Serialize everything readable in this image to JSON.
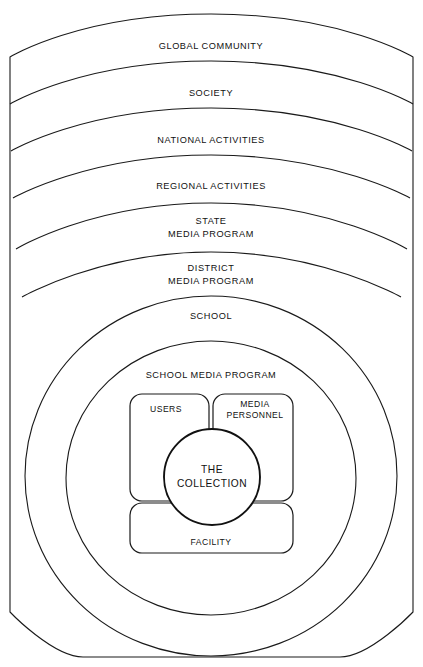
{
  "diagram": {
    "type": "concentric-nested-rings",
    "stroke_color": "#1a1a1a",
    "background_color": "#ffffff",
    "rings": [
      {
        "id": "global-community",
        "label": "GLOBAL COMMUNITY",
        "lines": [
          "GLOBAL COMMUNITY"
        ],
        "level": 1
      },
      {
        "id": "society",
        "label": "SOCIETY",
        "lines": [
          "SOCIETY"
        ],
        "level": 2
      },
      {
        "id": "national-activities",
        "label": "NATIONAL  ACTIVITIES",
        "lines": [
          "NATIONAL  ACTIVITIES"
        ],
        "level": 3
      },
      {
        "id": "regional-activities",
        "label": "REGIONAL  ACTIVITIES",
        "lines": [
          "REGIONAL  ACTIVITIES"
        ],
        "level": 4
      },
      {
        "id": "state-media-program",
        "label": "STATE MEDIA PROGRAM",
        "lines": [
          "STATE",
          "MEDIA PROGRAM"
        ],
        "level": 5
      },
      {
        "id": "district-media-program",
        "label": "DISTRICT MEDIA PROGRAM",
        "lines": [
          "DISTRICT",
          "MEDIA PROGRAM"
        ],
        "level": 6
      },
      {
        "id": "school",
        "label": "SCHOOL",
        "lines": [
          "SCHOOL"
        ],
        "level": 7
      },
      {
        "id": "school-media-program",
        "label": "SCHOOL MEDIA PROGRAM",
        "lines": [
          "SCHOOL MEDIA PROGRAM"
        ],
        "level": 8
      }
    ],
    "core": {
      "boxes": [
        {
          "id": "users",
          "label": "USERS",
          "lines": [
            "USERS"
          ],
          "position": "top-left"
        },
        {
          "id": "media-personnel",
          "label": "MEDIA PERSONNEL",
          "lines": [
            "MEDIA",
            "PERSONNEL"
          ],
          "position": "top-right"
        },
        {
          "id": "facility",
          "label": "FACILITY",
          "lines": [
            "FACILITY"
          ],
          "position": "bottom"
        }
      ],
      "center": {
        "id": "the-collection",
        "label": "THE COLLECTION",
        "lines": [
          "THE",
          "COLLECTION"
        ]
      }
    }
  }
}
